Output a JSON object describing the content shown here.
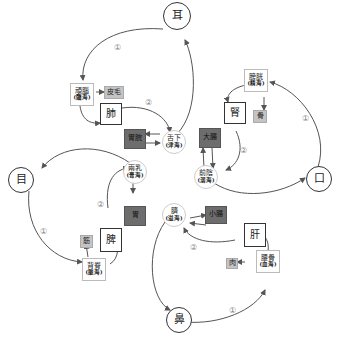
{
  "nodes": {
    "er": {
      "label": "耳"
    },
    "mu": {
      "label": "目"
    },
    "kou": {
      "label": "口"
    },
    "bi": {
      "label": "鼻"
    },
    "fei": {
      "label": "肺"
    },
    "shen": {
      "label": "腎"
    },
    "pi": {
      "label": "脾"
    },
    "gan": {
      "label": "肝"
    },
    "naosui": {
      "label": "頑腦",
      "sub": "(髓海)"
    },
    "pangguang": {
      "label": "膀胱",
      "sub": "(精海)"
    },
    "beiji": {
      "label": "背脊",
      "sub": "(脈海)"
    },
    "yaogu": {
      "label": "腰骨",
      "sub": "(血海)"
    },
    "shexia": {
      "label": "舌下",
      "sub": "(津海)"
    },
    "qianyin": {
      "label": "前陰",
      "sub": "(溺海)"
    },
    "liangru": {
      "label": "兩乳",
      "sub": "(膏海)"
    },
    "qi": {
      "label": "臍",
      "sub": "(溢海)"
    },
    "pimao": {
      "label": "皮毛"
    },
    "gu": {
      "label": "骨"
    },
    "jin": {
      "label": "筋"
    },
    "rou": {
      "label": "肉"
    },
    "weiwan": {
      "label": "胃脘"
    },
    "dachang": {
      "label": "大腸"
    },
    "wei": {
      "label": "胃"
    },
    "xiaochang": {
      "label": "小腸"
    }
  },
  "markers": {
    "one": "①",
    "two": "②"
  }
}
